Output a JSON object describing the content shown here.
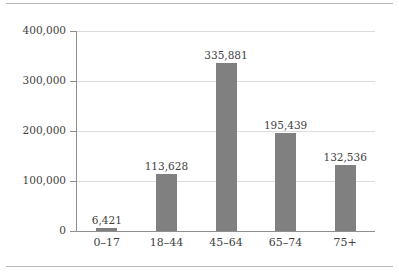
{
  "chart_data": {
    "type": "bar",
    "title": "",
    "subtitle": "",
    "xlabel": "",
    "ylabel": "",
    "categories": [
      "0–17",
      "18–44",
      "45–64",
      "65–74",
      "75+"
    ],
    "values": [
      6421,
      113628,
      335881,
      195439,
      132536
    ],
    "value_labels": [
      "6,421",
      "113,628",
      "335,881",
      "195,439",
      "132,536"
    ],
    "ylim": [
      0,
      400000
    ],
    "ytick_values": [
      0,
      100000,
      200000,
      300000,
      400000
    ],
    "ytick_labels": [
      "0",
      "100,000",
      "200,000",
      "300,000",
      "400,000"
    ],
    "grid": true,
    "legend": false,
    "legend_position": "none",
    "bar_color": "#808080",
    "gridline_color": "#dcdcdc",
    "axis_color": "#8f8f8f",
    "text_color": "#3f3f3f",
    "rule_color": "#b9b9b9",
    "data_labels_shown": true
  }
}
